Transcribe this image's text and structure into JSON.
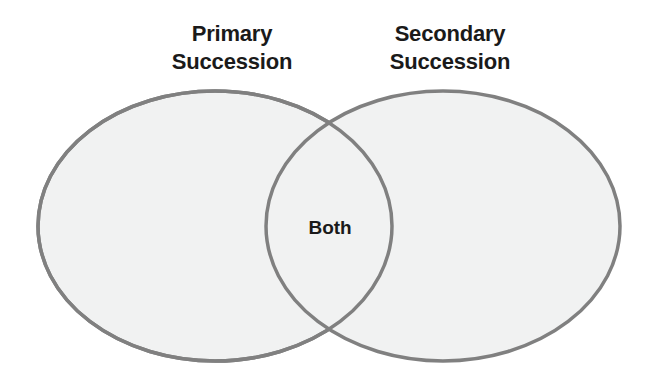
{
  "diagram": {
    "type": "venn-2-set",
    "title": "",
    "background_color": "#ffffff",
    "canvas": {
      "width": 658,
      "height": 383
    },
    "sets": [
      {
        "id": "primary",
        "label_line1": "Primary",
        "label_line2": "Succession",
        "fill_color": "#f1f2f2",
        "stroke_color": "#808080",
        "stroke_width": 3.5,
        "center_x": 215,
        "center_y": 226,
        "radius_x": 177,
        "radius_y": 135
      },
      {
        "id": "secondary",
        "label_line1": "Secondary",
        "label_line2": "Succession",
        "fill_color": "#f1f2f2",
        "stroke_color": "#808080",
        "stroke_width": 3.5,
        "center_x": 443,
        "center_y": 226,
        "radius_x": 177,
        "radius_y": 135
      }
    ],
    "intersection": {
      "id": "both",
      "label": "Both",
      "center_x": 330,
      "center_y": 230,
      "fill_color": "#f1f2f2"
    },
    "text_color": "#1a1a1a"
  }
}
